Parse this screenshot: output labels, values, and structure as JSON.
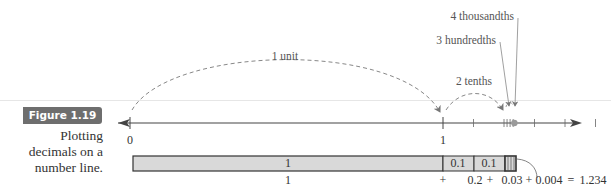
{
  "figure": {
    "badge": "Figure 1.19",
    "caption": "Plotting decimals on a number line.",
    "caption_lines": [
      "Plotting",
      "decimals on a",
      "number line."
    ]
  },
  "number_line": {
    "range": [
      0,
      2.0
    ],
    "labeled_ticks": [
      {
        "value": 0,
        "label": "0"
      },
      {
        "value": 1,
        "label": "1"
      }
    ],
    "minor_ticks": [
      1.1,
      1.2,
      1.21,
      1.22,
      1.23,
      1.3,
      1.4,
      1.5
    ],
    "plotted_point": 1.234
  },
  "annotations": {
    "unit_jump": "1 unit",
    "tenths_jump": "2 tenths",
    "hundredths": "3 hundredths",
    "thousandths": "4 thousandths"
  },
  "bar": {
    "segments": [
      {
        "label": "1",
        "value": 1
      },
      {
        "label": "0.1",
        "value": 0.1
      },
      {
        "label": "0.1",
        "value": 0.1
      }
    ],
    "hundredth_strips": 3,
    "thousandth_value": 0.004
  },
  "sum": {
    "term1": "1",
    "plus1": "+",
    "term2": "0.2",
    "plus2": "+",
    "term3": "0.03",
    "plus3": "+",
    "term4": "0.004",
    "equals": "=",
    "result": "1.234"
  },
  "colors": {
    "bar_fill": "#d9d9d9",
    "badge": "#6e6e6e",
    "line": "#444444",
    "point": "#9a9a9a"
  }
}
